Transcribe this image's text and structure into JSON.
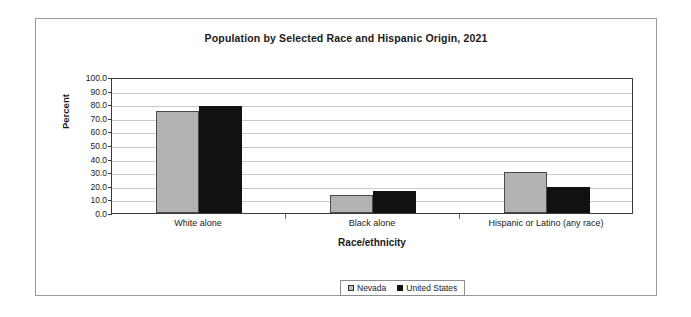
{
  "chart_data": {
    "type": "bar",
    "title": "Population by Selected Race and Hispanic Origin, 2021",
    "xlabel": "Race/ethnicity",
    "ylabel": "Percent",
    "categories": [
      "White alone",
      "Black alone",
      "Hispanic or Latino (any race)"
    ],
    "series": [
      {
        "name": "Nevada",
        "color": "#b3b3b3",
        "values": [
          75.0,
          13.0,
          30.0
        ]
      },
      {
        "name": "United States",
        "color": "#111111",
        "values": [
          79.0,
          16.0,
          19.0
        ]
      }
    ],
    "ylim": [
      0,
      100
    ],
    "y_ticks": [
      "100.0",
      "90.0",
      "80.0",
      "70.0",
      "60.0",
      "50.0",
      "40.0",
      "30.0",
      "20.0",
      "10.0",
      "0.0"
    ],
    "y_tick_values": [
      100,
      90,
      80,
      70,
      60,
      50,
      40,
      30,
      20,
      10,
      0
    ],
    "grid": true,
    "legend_position": "bottom"
  }
}
